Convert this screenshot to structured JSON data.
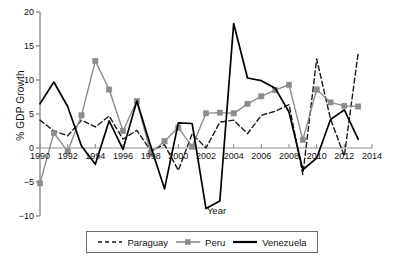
{
  "chart_data": {
    "type": "line",
    "title": "",
    "xlabel": "Year",
    "ylabel": "% GDP Growth",
    "xlim": [
      1990,
      2014
    ],
    "ylim": [
      -10,
      20
    ],
    "yticks": [
      20,
      15,
      10,
      5,
      0,
      -5,
      -10
    ],
    "ytick_labels": [
      "20",
      "15",
      "10",
      "5",
      "0",
      "−5",
      "−10"
    ],
    "xticks": [
      1990,
      1992,
      1994,
      1996,
      1998,
      2000,
      2002,
      2004,
      2006,
      2008,
      2010,
      2012,
      2014
    ],
    "xtick_labels": [
      "1990",
      "1992",
      "1994",
      "1996",
      "1998",
      "2000",
      "2002",
      "2004",
      "2006",
      "2008",
      "2010",
      "2012",
      "2014"
    ],
    "grid": false,
    "legend_position": "bottom",
    "x": [
      1990,
      1991,
      1992,
      1993,
      1994,
      1995,
      1996,
      1997,
      1998,
      1999,
      2000,
      2001,
      2002,
      2003,
      2004,
      2005,
      2006,
      2007,
      2008,
      2009,
      2010,
      2011,
      2012,
      2013
    ],
    "series": [
      {
        "name": "Paraguay",
        "color": "#1a1a1a",
        "style": "dashed",
        "marker": "none",
        "values": [
          4.1,
          2.5,
          1.8,
          4.1,
          3.1,
          4.7,
          1.3,
          2.6,
          -0.4,
          0.5,
          -3.3,
          2.1,
          0.0,
          3.8,
          4.1,
          2.1,
          4.8,
          5.4,
          6.4,
          -3.9,
          13.1,
          4.3,
          -1.2,
          14.0
        ]
      },
      {
        "name": "Peru",
        "color": "#8c8c8c",
        "style": "solid",
        "marker": "square",
        "values": [
          -5.2,
          2.2,
          -0.5,
          4.8,
          12.8,
          8.6,
          2.5,
          6.9,
          -0.7,
          1.0,
          3.0,
          0.2,
          5.1,
          5.2,
          5.1,
          6.5,
          7.6,
          8.5,
          9.3,
          1.2,
          8.6,
          6.7,
          6.2,
          6.1
        ]
      },
      {
        "name": "Venezuela",
        "color": "#000000",
        "style": "solid",
        "marker": "none",
        "values": [
          6.5,
          9.7,
          6.1,
          0.3,
          -2.4,
          4.0,
          -0.2,
          6.9,
          0.3,
          -6.0,
          3.7,
          3.6,
          -8.9,
          -7.8,
          18.3,
          10.3,
          9.9,
          8.8,
          5.3,
          -3.2,
          -1.5,
          4.2,
          5.6,
          1.3
        ]
      }
    ]
  },
  "axis": {
    "y_title": "% GDP Growth",
    "x_title": "Year"
  },
  "legend": {
    "items": [
      {
        "label": "Paraguay",
        "swatch": "dashed-line-swatch"
      },
      {
        "label": "Peru",
        "swatch": "gray-square-marker-line-swatch"
      },
      {
        "label": "Venezuela",
        "swatch": "solid-line-swatch"
      }
    ]
  }
}
